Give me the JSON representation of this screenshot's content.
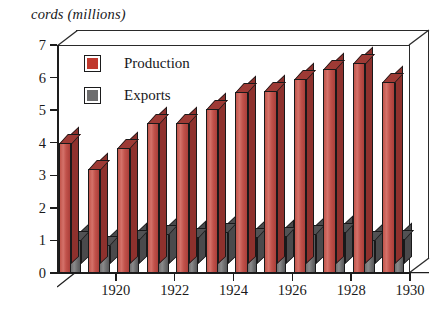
{
  "chart_data": {
    "type": "bar",
    "title": "",
    "ylabel": "cords (millions)",
    "xlabel": "",
    "ylim": [
      0,
      7
    ],
    "yticks": [
      0,
      1,
      2,
      3,
      4,
      5,
      6,
      7
    ],
    "grid": false,
    "legend_position": "top-left",
    "categories": [
      1919,
      1920,
      1921,
      1922,
      1923,
      1924,
      1925,
      1926,
      1927,
      1928,
      1929,
      1930
    ],
    "xtick_labels": [
      "1920",
      "1922",
      "1924",
      "1926",
      "1928",
      "1930"
    ],
    "series": [
      {
        "name": "Production",
        "color": "#c0392e",
        "values": [
          4.0,
          3.2,
          3.85,
          4.6,
          4.6,
          5.05,
          5.55,
          5.6,
          5.95,
          6.25,
          6.45,
          5.85
        ]
      },
      {
        "name": "Exports",
        "color": "#6d6d6e",
        "values": [
          1.0,
          0.85,
          1.05,
          1.2,
          1.1,
          1.25,
          1.1,
          1.15,
          1.2,
          1.25,
          1.0,
          1.05
        ]
      }
    ]
  },
  "legend": {
    "items": [
      {
        "label": "Production",
        "swatch": "red-swatch"
      },
      {
        "label": "Exports",
        "swatch": "gray-swatch"
      }
    ]
  }
}
